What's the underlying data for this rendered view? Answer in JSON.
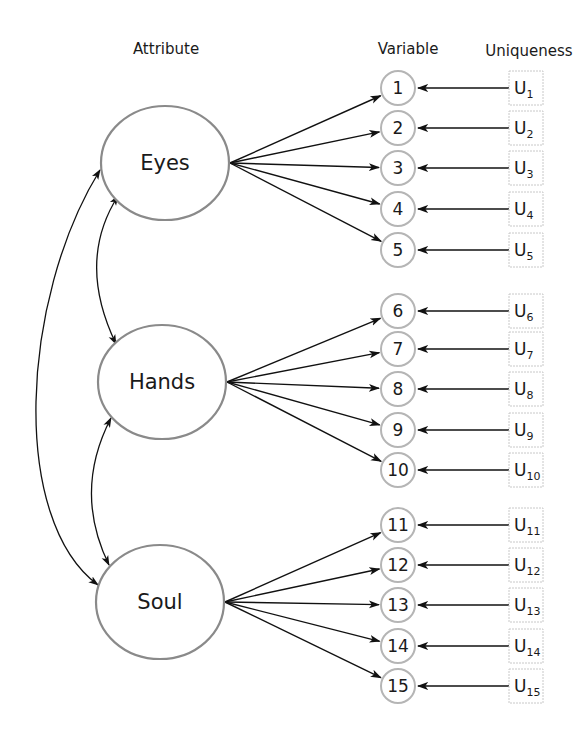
{
  "headers": {
    "attribute": "Attribute",
    "variable": "Variable",
    "uniqueness": "Uniqueness"
  },
  "colors": {
    "node_stroke": "#8a8a8a",
    "variable_stroke": "#b5b5b5",
    "uniqueness_stroke": "#c8c8c8",
    "arrow": "#111111"
  },
  "factors": [
    {
      "name": "Eyes",
      "cx": 165,
      "cy": 163,
      "variables": [
        1,
        2,
        3,
        4,
        5
      ]
    },
    {
      "name": "Hands",
      "cx": 162,
      "cy": 382,
      "variables": [
        6,
        7,
        8,
        9,
        10
      ]
    },
    {
      "name": "Soul",
      "cx": 160,
      "cy": 602,
      "variables": [
        11,
        12,
        13,
        14,
        15
      ]
    }
  ],
  "variables": [
    {
      "id": "1",
      "y": 88
    },
    {
      "id": "2",
      "y": 128
    },
    {
      "id": "3",
      "y": 168
    },
    {
      "id": "4",
      "y": 209
    },
    {
      "id": "5",
      "y": 250
    },
    {
      "id": "6",
      "y": 311
    },
    {
      "id": "7",
      "y": 349
    },
    {
      "id": "8",
      "y": 389
    },
    {
      "id": "9",
      "y": 430
    },
    {
      "id": "10",
      "y": 470
    },
    {
      "id": "11",
      "y": 525
    },
    {
      "id": "12",
      "y": 565
    },
    {
      "id": "13",
      "y": 605
    },
    {
      "id": "14",
      "y": 646
    },
    {
      "id": "15",
      "y": 686
    }
  ],
  "uniqueness": [
    {
      "base": "U",
      "sub": "1"
    },
    {
      "base": "U",
      "sub": "2"
    },
    {
      "base": "U",
      "sub": "3"
    },
    {
      "base": "U",
      "sub": "4"
    },
    {
      "base": "U",
      "sub": "5"
    },
    {
      "base": "U",
      "sub": "6"
    },
    {
      "base": "U",
      "sub": "7"
    },
    {
      "base": "U",
      "sub": "8"
    },
    {
      "base": "U",
      "sub": "9"
    },
    {
      "base": "U",
      "sub": "10"
    },
    {
      "base": "U",
      "sub": "11"
    },
    {
      "base": "U",
      "sub": "12"
    },
    {
      "base": "U",
      "sub": "13"
    },
    {
      "base": "U",
      "sub": "14"
    },
    {
      "base": "U",
      "sub": "15"
    }
  ],
  "correlations": [
    {
      "from": "Eyes",
      "to": "Hands"
    },
    {
      "from": "Hands",
      "to": "Soul"
    },
    {
      "from": "Eyes",
      "to": "Soul"
    }
  ]
}
